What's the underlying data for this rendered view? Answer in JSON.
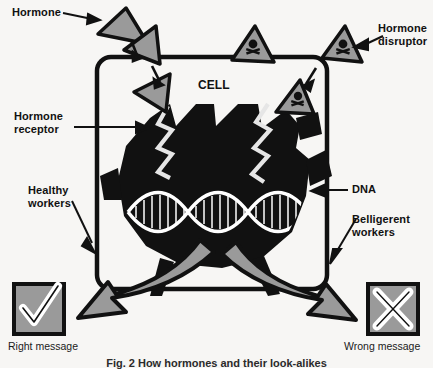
{
  "figure": {
    "type": "scientific-diagram",
    "caption": "Fig. 2  How hormones and their look-alikes",
    "cell_label": "CELL",
    "background_color": "#f7f6f4",
    "ink_color": "#111111",
    "fill_gray": "#9a9a9a",
    "white": "#ffffff"
  },
  "labels": {
    "hormone": "Hormone",
    "hormone_disruptor": "Hormone\ndisruptor",
    "hormone_receptor": "Hormone\nreceptor",
    "dna": "DNA",
    "healthy_workers": "Healthy\nworkers",
    "belligerent_workers": "Belligerent\nworkers"
  },
  "outcomes": {
    "right": {
      "caption": "Right message",
      "symbol": "check"
    },
    "wrong": {
      "caption": "Wrong message",
      "symbol": "cross"
    }
  },
  "icons": {
    "hormone": "triangle-icon",
    "disruptor": "skull-triangle-icon",
    "dna": "dna-helix-icon",
    "check": "check-icon",
    "cross": "cross-icon"
  }
}
